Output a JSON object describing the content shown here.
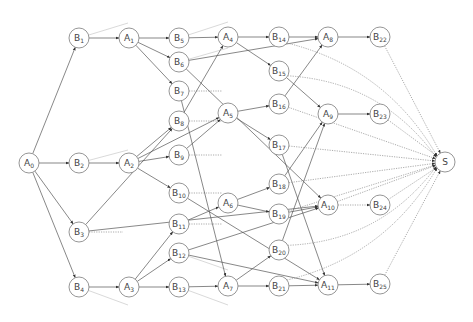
{
  "diagram": {
    "type": "directed-graph",
    "colors": {
      "node_stroke": "#8a8a8a",
      "edge": "#555555",
      "dotted_edge": "#888888",
      "background": "#ffffff"
    },
    "nodes": [
      {
        "id": "A0",
        "base": "A",
        "sub": "0",
        "x": 29,
        "y": 163
      },
      {
        "id": "B1",
        "base": "B",
        "sub": "1",
        "x": 79,
        "y": 38
      },
      {
        "id": "B2",
        "base": "B",
        "sub": "2",
        "x": 79,
        "y": 163
      },
      {
        "id": "B3",
        "base": "B",
        "sub": "3",
        "x": 79,
        "y": 232
      },
      {
        "id": "B4",
        "base": "B",
        "sub": "4",
        "x": 79,
        "y": 287
      },
      {
        "id": "A1",
        "base": "A",
        "sub": "1",
        "x": 129,
        "y": 38
      },
      {
        "id": "A2",
        "base": "A",
        "sub": "2",
        "x": 129,
        "y": 163
      },
      {
        "id": "A3",
        "base": "A",
        "sub": "3",
        "x": 129,
        "y": 287
      },
      {
        "id": "B5",
        "base": "B",
        "sub": "5",
        "x": 179,
        "y": 38
      },
      {
        "id": "B6",
        "base": "B",
        "sub": "6",
        "x": 179,
        "y": 62
      },
      {
        "id": "B7",
        "base": "B",
        "sub": "7",
        "x": 179,
        "y": 91
      },
      {
        "id": "B8",
        "base": "B",
        "sub": "8",
        "x": 179,
        "y": 121
      },
      {
        "id": "B9",
        "base": "B",
        "sub": "9",
        "x": 179,
        "y": 155
      },
      {
        "id": "B10",
        "base": "B",
        "sub": "10",
        "x": 179,
        "y": 193
      },
      {
        "id": "B11",
        "base": "B",
        "sub": "11",
        "x": 179,
        "y": 224
      },
      {
        "id": "B12",
        "base": "B",
        "sub": "12",
        "x": 179,
        "y": 253
      },
      {
        "id": "B13",
        "base": "B",
        "sub": "13",
        "x": 179,
        "y": 287
      },
      {
        "id": "A4",
        "base": "A",
        "sub": "4",
        "x": 228,
        "y": 37
      },
      {
        "id": "A5",
        "base": "A",
        "sub": "5",
        "x": 228,
        "y": 113
      },
      {
        "id": "A6",
        "base": "A",
        "sub": "6",
        "x": 228,
        "y": 203
      },
      {
        "id": "A7",
        "base": "A",
        "sub": "7",
        "x": 228,
        "y": 286
      },
      {
        "id": "B14",
        "base": "B",
        "sub": "14",
        "x": 279,
        "y": 37
      },
      {
        "id": "B15",
        "base": "B",
        "sub": "15",
        "x": 279,
        "y": 71
      },
      {
        "id": "B16",
        "base": "B",
        "sub": "16",
        "x": 279,
        "y": 104
      },
      {
        "id": "B17",
        "base": "B",
        "sub": "17",
        "x": 279,
        "y": 145
      },
      {
        "id": "B18",
        "base": "B",
        "sub": "18",
        "x": 279,
        "y": 184
      },
      {
        "id": "B19",
        "base": "B",
        "sub": "19",
        "x": 279,
        "y": 214
      },
      {
        "id": "B20",
        "base": "B",
        "sub": "20",
        "x": 279,
        "y": 250
      },
      {
        "id": "B21",
        "base": "B",
        "sub": "21",
        "x": 279,
        "y": 286
      },
      {
        "id": "A8",
        "base": "A",
        "sub": "8",
        "x": 328,
        "y": 37
      },
      {
        "id": "A9",
        "base": "A",
        "sub": "9",
        "x": 328,
        "y": 114
      },
      {
        "id": "A10",
        "base": "A",
        "sub": "10",
        "x": 328,
        "y": 205
      },
      {
        "id": "A11",
        "base": "A",
        "sub": "11",
        "x": 328,
        "y": 285
      },
      {
        "id": "B22",
        "base": "B",
        "sub": "22",
        "x": 380,
        "y": 37
      },
      {
        "id": "B23",
        "base": "B",
        "sub": "23",
        "x": 380,
        "y": 114
      },
      {
        "id": "B24",
        "base": "B",
        "sub": "24",
        "x": 380,
        "y": 205
      },
      {
        "id": "B25",
        "base": "B",
        "sub": "25",
        "x": 380,
        "y": 284
      },
      {
        "id": "S",
        "base": "S",
        "sub": "",
        "x": 445,
        "y": 162
      }
    ],
    "edges": [
      {
        "from": "A0",
        "to": "B1",
        "style": "solid"
      },
      {
        "from": "A0",
        "to": "B2",
        "style": "solid"
      },
      {
        "from": "A0",
        "to": "B3",
        "style": "solid"
      },
      {
        "from": "A0",
        "to": "B4",
        "style": "solid"
      },
      {
        "from": "B1",
        "to": "A1",
        "style": "solid"
      },
      {
        "from": "B2",
        "to": "A2",
        "style": "solid"
      },
      {
        "from": "B4",
        "to": "A3",
        "style": "solid"
      },
      {
        "from": "A1",
        "to": "B5",
        "style": "solid"
      },
      {
        "from": "A1",
        "to": "B6",
        "style": "solid"
      },
      {
        "from": "A1",
        "to": "B7",
        "style": "solid"
      },
      {
        "from": "A2",
        "to": "B8",
        "style": "solid"
      },
      {
        "from": "A2",
        "to": "B9",
        "style": "solid"
      },
      {
        "from": "A2",
        "to": "B10",
        "style": "solid"
      },
      {
        "from": "A2",
        "to": "A5",
        "style": "solid"
      },
      {
        "from": "B3",
        "to": "B8",
        "style": "solid"
      },
      {
        "from": "B3",
        "to": "A10",
        "style": "solid"
      },
      {
        "from": "A3",
        "to": "B11",
        "style": "solid"
      },
      {
        "from": "A3",
        "to": "B12",
        "style": "solid"
      },
      {
        "from": "A3",
        "to": "B13",
        "style": "solid"
      },
      {
        "from": "B5",
        "to": "A4",
        "style": "solid"
      },
      {
        "from": "B6",
        "to": "A8",
        "style": "solid"
      },
      {
        "from": "B6",
        "to": "A10",
        "style": "solid"
      },
      {
        "from": "B7",
        "to": "A7",
        "style": "solid"
      },
      {
        "from": "B8",
        "to": "A4",
        "style": "solid"
      },
      {
        "from": "B9",
        "to": "A5",
        "style": "solid"
      },
      {
        "from": "B10",
        "to": "A11",
        "style": "solid"
      },
      {
        "from": "B11",
        "to": "A6",
        "style": "solid"
      },
      {
        "from": "B12",
        "to": "A10",
        "style": "solid"
      },
      {
        "from": "B12",
        "to": "A11",
        "style": "solid"
      },
      {
        "from": "B13",
        "to": "A7",
        "style": "solid"
      },
      {
        "from": "A4",
        "to": "B14",
        "style": "solid"
      },
      {
        "from": "A4",
        "to": "B15",
        "style": "solid"
      },
      {
        "from": "A5",
        "to": "B16",
        "style": "solid"
      },
      {
        "from": "A5",
        "to": "B17",
        "style": "solid"
      },
      {
        "from": "A6",
        "to": "B18",
        "style": "solid"
      },
      {
        "from": "A6",
        "to": "B19",
        "style": "solid"
      },
      {
        "from": "A7",
        "to": "B20",
        "style": "solid"
      },
      {
        "from": "A7",
        "to": "B21",
        "style": "solid"
      },
      {
        "from": "B14",
        "to": "A8",
        "style": "solid"
      },
      {
        "from": "B15",
        "to": "A9",
        "style": "solid"
      },
      {
        "from": "B16",
        "to": "A8",
        "style": "solid"
      },
      {
        "from": "B17",
        "to": "A11",
        "style": "solid"
      },
      {
        "from": "B18",
        "to": "A9",
        "style": "solid"
      },
      {
        "from": "B19",
        "to": "A10",
        "style": "solid"
      },
      {
        "from": "B20",
        "to": "A9",
        "style": "solid"
      },
      {
        "from": "B21",
        "to": "A11",
        "style": "solid"
      },
      {
        "from": "A8",
        "to": "B22",
        "style": "solid"
      },
      {
        "from": "A9",
        "to": "B23",
        "style": "solid"
      },
      {
        "from": "A10",
        "to": "B24",
        "style": "dotted"
      },
      {
        "from": "A11",
        "to": "B25",
        "style": "solid"
      },
      {
        "from": "B14",
        "to": "S",
        "style": "dotted",
        "curve": true
      },
      {
        "from": "B15",
        "to": "S",
        "style": "dotted",
        "curve": true
      },
      {
        "from": "B16",
        "to": "S",
        "style": "dotted"
      },
      {
        "from": "B17",
        "to": "S",
        "style": "dotted"
      },
      {
        "from": "B18",
        "to": "S",
        "style": "dotted"
      },
      {
        "from": "B19",
        "to": "S",
        "style": "dotted"
      },
      {
        "from": "B20",
        "to": "S",
        "style": "dotted",
        "curve": true
      },
      {
        "from": "B21",
        "to": "S",
        "style": "dotted",
        "curve": true
      },
      {
        "from": "B22",
        "to": "S",
        "style": "dotted"
      },
      {
        "from": "B23",
        "to": "S",
        "style": "dotted"
      },
      {
        "from": "B24",
        "to": "S",
        "style": "dotted"
      },
      {
        "from": "B25",
        "to": "S",
        "style": "dotted"
      },
      {
        "from": "A10",
        "to": "S",
        "style": "dotted"
      }
    ],
    "stubs": [
      {
        "from": "B1",
        "x2": 128,
        "y2": 23,
        "style": "light"
      },
      {
        "from": "B2",
        "x2": 128,
        "y2": 150,
        "style": "light"
      },
      {
        "from": "B3",
        "x2": 123,
        "y2": 232,
        "style": "dotted"
      },
      {
        "from": "B4",
        "x2": 128,
        "y2": 305,
        "style": "light"
      },
      {
        "from": "B5",
        "x2": 228,
        "y2": 22,
        "style": "light"
      },
      {
        "from": "B6",
        "x2": 228,
        "y2": 48,
        "style": "light"
      },
      {
        "from": "B7",
        "x2": 222,
        "y2": 91,
        "style": "dotted"
      },
      {
        "from": "B8",
        "x2": 222,
        "y2": 121,
        "style": "dotted"
      },
      {
        "from": "B9",
        "x2": 222,
        "y2": 155,
        "style": "dotted"
      },
      {
        "from": "B10",
        "x2": 222,
        "y2": 193,
        "style": "dotted"
      },
      {
        "from": "B11",
        "x2": 222,
        "y2": 224,
        "style": "dotted"
      },
      {
        "from": "B12",
        "x2": 228,
        "y2": 270,
        "style": "light"
      },
      {
        "from": "B13",
        "x2": 228,
        "y2": 305,
        "style": "light"
      }
    ]
  }
}
